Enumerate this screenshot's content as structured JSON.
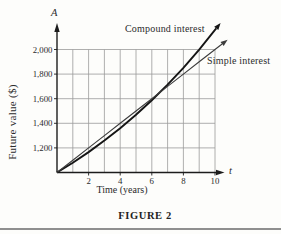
{
  "figure": {
    "caption": "FIGURE 2",
    "colors": {
      "background": "#fdfdfb",
      "grid": "#9b9b9b",
      "axis": "#1c1c1c",
      "compound_line": "#151515",
      "simple_line": "#3c3c3c",
      "text": "#2b2b2b",
      "divider": "#8f8f8f"
    }
  },
  "chart_data": {
    "type": "line",
    "title": "",
    "caption": "FIGURE 2",
    "xlabel": "Time (years)",
    "ylabel": "Future value ($)",
    "x_axis_symbol": "t",
    "y_axis_symbol": "A",
    "x": [
      0,
      1,
      2,
      3,
      4,
      5,
      6,
      7,
      8,
      9,
      10
    ],
    "x_ticks": [
      2,
      4,
      6,
      8,
      10
    ],
    "x_tick_labels": [
      "2",
      "4",
      "6",
      "8",
      "10"
    ],
    "y_ticks": [
      1200,
      1400,
      1600,
      1800,
      2000
    ],
    "y_tick_labels": [
      "1,200",
      "1,400",
      "1,600",
      "1,800",
      "2,000"
    ],
    "xlim": [
      0,
      10
    ],
    "ylim": [
      1000,
      2000
    ],
    "grid": true,
    "legend_position": "inline-labels",
    "series": [
      {
        "name": "Compound interest",
        "values": [
          1000,
          1080,
          1166,
          1260,
          1360,
          1469,
          1587,
          1714,
          1851,
          1999,
          2159
        ]
      },
      {
        "name": "Simple interest",
        "values": [
          1000,
          1100,
          1200,
          1300,
          1400,
          1500,
          1600,
          1700,
          1800,
          1900,
          2000
        ]
      }
    ]
  }
}
